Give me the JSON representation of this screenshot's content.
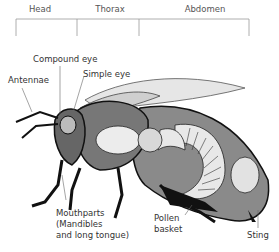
{
  "diagram": {
    "segments": [
      {
        "label": "Head"
      },
      {
        "label": "Thorax"
      },
      {
        "label": "Abdomen"
      }
    ],
    "labels": {
      "compound_eye": "Compound eye",
      "simple_eye": "Simple eye",
      "antennae": "Antennae",
      "mouthparts_1": "Mouthparts",
      "mouthparts_2": "(Mandibles",
      "mouthparts_3": "and long tongue)",
      "pollen_basket_1": "Pollen",
      "pollen_basket_2": "basket",
      "sting": "Sting"
    }
  }
}
